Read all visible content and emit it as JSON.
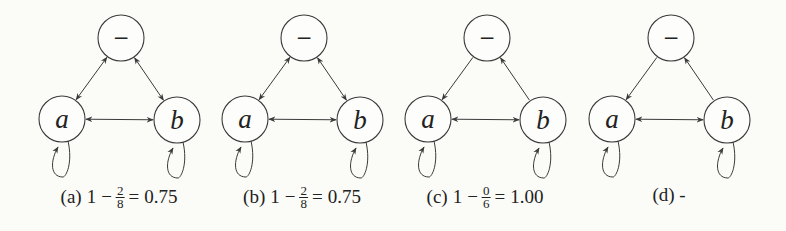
{
  "figure": {
    "colors": {
      "background": "#fbfbf8",
      "stroke": "#3a3a3a",
      "text": "#222222"
    },
    "node_labels": {
      "top": "−",
      "left": "a",
      "right": "b"
    },
    "panels": [
      {
        "id": "a",
        "offset_x": 0,
        "edges": {
          "top_left": "bidirectional",
          "top_right": "bidirectional",
          "left_right": "bidirectional",
          "self_loop_left": true,
          "self_loop_right": true
        },
        "caption": {
          "tag": "(a)",
          "lhs": "1",
          "op": "−",
          "num": "2",
          "den": "8",
          "eq": "=",
          "value": "0.75"
        }
      },
      {
        "id": "b",
        "offset_x": 183,
        "edges": {
          "top_left": "bidirectional",
          "top_right": "bidirectional",
          "left_right": "bidirectional",
          "self_loop_left": true,
          "self_loop_right": true
        },
        "caption": {
          "tag": "(b)",
          "lhs": "1",
          "op": "−",
          "num": "2",
          "den": "8",
          "eq": "=",
          "value": "0.75"
        }
      },
      {
        "id": "c",
        "offset_x": 366,
        "edges": {
          "top_left": "top_to_left",
          "top_right": "right_to_top",
          "left_right": "bidirectional",
          "self_loop_left": true,
          "self_loop_right": true
        },
        "caption": {
          "tag": "(c)",
          "lhs": "1",
          "op": "−",
          "num": "0",
          "den": "6",
          "eq": "=",
          "value": "1.00"
        }
      },
      {
        "id": "d",
        "offset_x": 550,
        "edges": {
          "top_left": "top_to_left",
          "top_right": "right_to_top",
          "left_right": "bidirectional",
          "self_loop_left": true,
          "self_loop_right": true
        },
        "caption": {
          "tag": "(d) -"
        }
      }
    ]
  }
}
